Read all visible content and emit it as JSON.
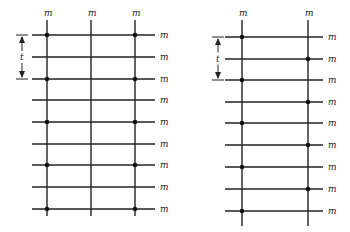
{
  "diagrams": [
    {
      "name": "left-grid",
      "vertical_x": [
        47,
        91,
        135
      ],
      "vertical_top": 20,
      "vertical_bottom": 216,
      "h_left": 32,
      "h_right": 155,
      "rows_y": [
        35,
        57,
        79,
        100,
        122,
        144,
        165,
        187,
        209
      ],
      "top_labels": [
        "m",
        "m",
        "m"
      ],
      "row_labels": [
        "m",
        "m",
        "m",
        "m",
        "m",
        "m",
        "m",
        "m",
        "m"
      ],
      "dots": [
        {
          "col": 0,
          "row": 0
        },
        {
          "col": 2,
          "row": 0
        },
        {
          "col": 0,
          "row": 2
        },
        {
          "col": 2,
          "row": 2
        },
        {
          "col": 0,
          "row": 4
        },
        {
          "col": 2,
          "row": 4
        },
        {
          "col": 0,
          "row": 6
        },
        {
          "col": 2,
          "row": 6
        },
        {
          "col": 0,
          "row": 8
        },
        {
          "col": 2,
          "row": 8
        }
      ],
      "bracket": {
        "x": 22,
        "y1": 35,
        "y2": 79,
        "label": "t"
      }
    },
    {
      "name": "right-grid",
      "vertical_x": [
        242,
        308
      ],
      "vertical_top": 20,
      "vertical_bottom": 226,
      "h_left": 225,
      "h_right": 323,
      "rows_y": [
        37,
        59,
        80,
        102,
        123,
        145,
        167,
        189,
        211
      ],
      "top_labels": [
        "m",
        "m"
      ],
      "row_labels": [
        "m",
        "m",
        "m",
        "m",
        "m",
        "m",
        "m",
        "m",
        "m"
      ],
      "dots": [
        {
          "col": 0,
          "row": 0
        },
        {
          "col": 1,
          "row": 1
        },
        {
          "col": 0,
          "row": 2
        },
        {
          "col": 1,
          "row": 3
        },
        {
          "col": 0,
          "row": 4
        },
        {
          "col": 1,
          "row": 5
        },
        {
          "col": 0,
          "row": 6
        },
        {
          "col": 1,
          "row": 7
        },
        {
          "col": 0,
          "row": 8
        }
      ],
      "bracket": {
        "x": 218,
        "y1": 37,
        "y2": 80,
        "label": "t"
      }
    }
  ]
}
